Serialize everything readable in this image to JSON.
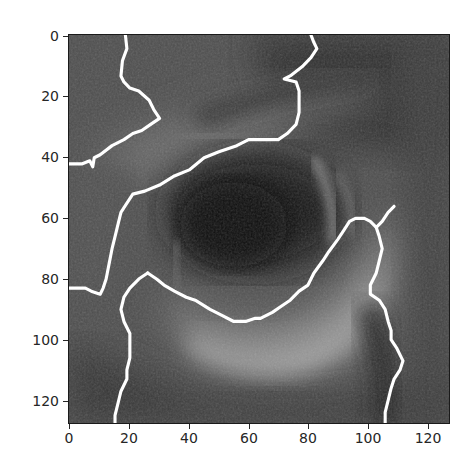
{
  "figure": {
    "type": "imshow",
    "image_size": [
      128,
      128
    ],
    "boundary_color": "#ffffff",
    "colormap": "gray"
  },
  "axes": {
    "x_ticks": [
      {
        "value": 0,
        "label": "0"
      },
      {
        "value": 20,
        "label": "20"
      },
      {
        "value": 40,
        "label": "40"
      },
      {
        "value": 60,
        "label": "60"
      },
      {
        "value": 80,
        "label": "80"
      },
      {
        "value": 100,
        "label": "100"
      },
      {
        "value": 120,
        "label": "120"
      }
    ],
    "y_ticks": [
      {
        "value": 0,
        "label": "0"
      },
      {
        "value": 20,
        "label": "20"
      },
      {
        "value": 40,
        "label": "40"
      },
      {
        "value": 60,
        "label": "60"
      },
      {
        "value": 80,
        "label": "80"
      },
      {
        "value": 100,
        "label": "100"
      },
      {
        "value": 120,
        "label": "120"
      }
    ],
    "xlim": [
      -0.5,
      127.5
    ],
    "ylim": [
      127.5,
      -0.5
    ]
  },
  "segment_boundaries": [
    {
      "name": "upper-left-boundary",
      "points": [
        [
          18.5,
          -0.5
        ],
        [
          19,
          4
        ],
        [
          17.5,
          8
        ],
        [
          17,
          13
        ],
        [
          18,
          15
        ],
        [
          20,
          17
        ],
        [
          23,
          18
        ],
        [
          26.5,
          21
        ],
        [
          28,
          24
        ],
        [
          30,
          27
        ],
        [
          27,
          29
        ],
        [
          24,
          31
        ],
        [
          21,
          32
        ],
        [
          18,
          34
        ],
        [
          14,
          36
        ],
        [
          10,
          39
        ],
        [
          8,
          40
        ],
        [
          7.5,
          43
        ],
        [
          6.5,
          41
        ],
        [
          4,
          42
        ],
        [
          0,
          42
        ],
        [
          -0.5,
          42
        ]
      ]
    },
    {
      "name": "eyelid-crease-boundary",
      "points": [
        [
          81,
          -0.5
        ],
        [
          82,
          2
        ],
        [
          83,
          4
        ],
        [
          81,
          7
        ],
        [
          78,
          10
        ],
        [
          74,
          13
        ],
        [
          72,
          14
        ],
        [
          76,
          15
        ],
        [
          77,
          18
        ],
        [
          77,
          21
        ],
        [
          77,
          25
        ],
        [
          76,
          29
        ],
        [
          73,
          32
        ],
        [
          70,
          34
        ],
        [
          65,
          34
        ],
        [
          60,
          34
        ],
        [
          56,
          36
        ],
        [
          50,
          38
        ],
        [
          45,
          40
        ],
        [
          40,
          44
        ],
        [
          35,
          46
        ],
        [
          30,
          49
        ],
        [
          25,
          51
        ],
        [
          21,
          52
        ],
        [
          19,
          55
        ],
        [
          17,
          58
        ],
        [
          16,
          62
        ],
        [
          15,
          66
        ],
        [
          14,
          70
        ],
        [
          13,
          75
        ],
        [
          12,
          80
        ],
        [
          11,
          83
        ],
        [
          10,
          85
        ],
        [
          7,
          84
        ],
        [
          5,
          83
        ],
        [
          2,
          83
        ],
        [
          -0.5,
          83
        ]
      ]
    },
    {
      "name": "lower-left-boundary",
      "points": [
        [
          26,
          78
        ],
        [
          23,
          80
        ],
        [
          20,
          83
        ],
        [
          18,
          86
        ],
        [
          17,
          90
        ],
        [
          18,
          94
        ],
        [
          20,
          98
        ],
        [
          20,
          102
        ],
        [
          20,
          106
        ],
        [
          19,
          110
        ],
        [
          19,
          113
        ],
        [
          17,
          117
        ],
        [
          16,
          121
        ],
        [
          15,
          125
        ],
        [
          15,
          127.5
        ]
      ]
    },
    {
      "name": "lower-lid-boundary",
      "points": [
        [
          26,
          78
        ],
        [
          29,
          80
        ],
        [
          31.5,
          82
        ],
        [
          35,
          84
        ],
        [
          39,
          86
        ],
        [
          42,
          87
        ],
        [
          47,
          90
        ],
        [
          51,
          92
        ],
        [
          55,
          94
        ],
        [
          59,
          94
        ],
        [
          62,
          93
        ],
        [
          64,
          93
        ],
        [
          68,
          91
        ],
        [
          71,
          89
        ],
        [
          74,
          87
        ],
        [
          77,
          84
        ],
        [
          80,
          82
        ],
        [
          82,
          78
        ],
        [
          85,
          74
        ],
        [
          87,
          71
        ],
        [
          90,
          67
        ],
        [
          92,
          64
        ],
        [
          94,
          61
        ],
        [
          96,
          60
        ],
        [
          99,
          60
        ],
        [
          101,
          61
        ],
        [
          103,
          63
        ],
        [
          105,
          61
        ],
        [
          107,
          58
        ],
        [
          109,
          56
        ]
      ]
    },
    {
      "name": "right-boundary",
      "points": [
        [
          103,
          63
        ],
        [
          104,
          66
        ],
        [
          105,
          70
        ],
        [
          104,
          74
        ],
        [
          103,
          78
        ],
        [
          101,
          82
        ],
        [
          101,
          85
        ],
        [
          104,
          87
        ],
        [
          106,
          90
        ],
        [
          107,
          94
        ],
        [
          108,
          97
        ],
        [
          108,
          100
        ],
        [
          110,
          103
        ],
        [
          112,
          107
        ],
        [
          111,
          110
        ],
        [
          109,
          113
        ],
        [
          108,
          116
        ],
        [
          107,
          120
        ],
        [
          106,
          124
        ],
        [
          106,
          127.5
        ]
      ]
    }
  ]
}
